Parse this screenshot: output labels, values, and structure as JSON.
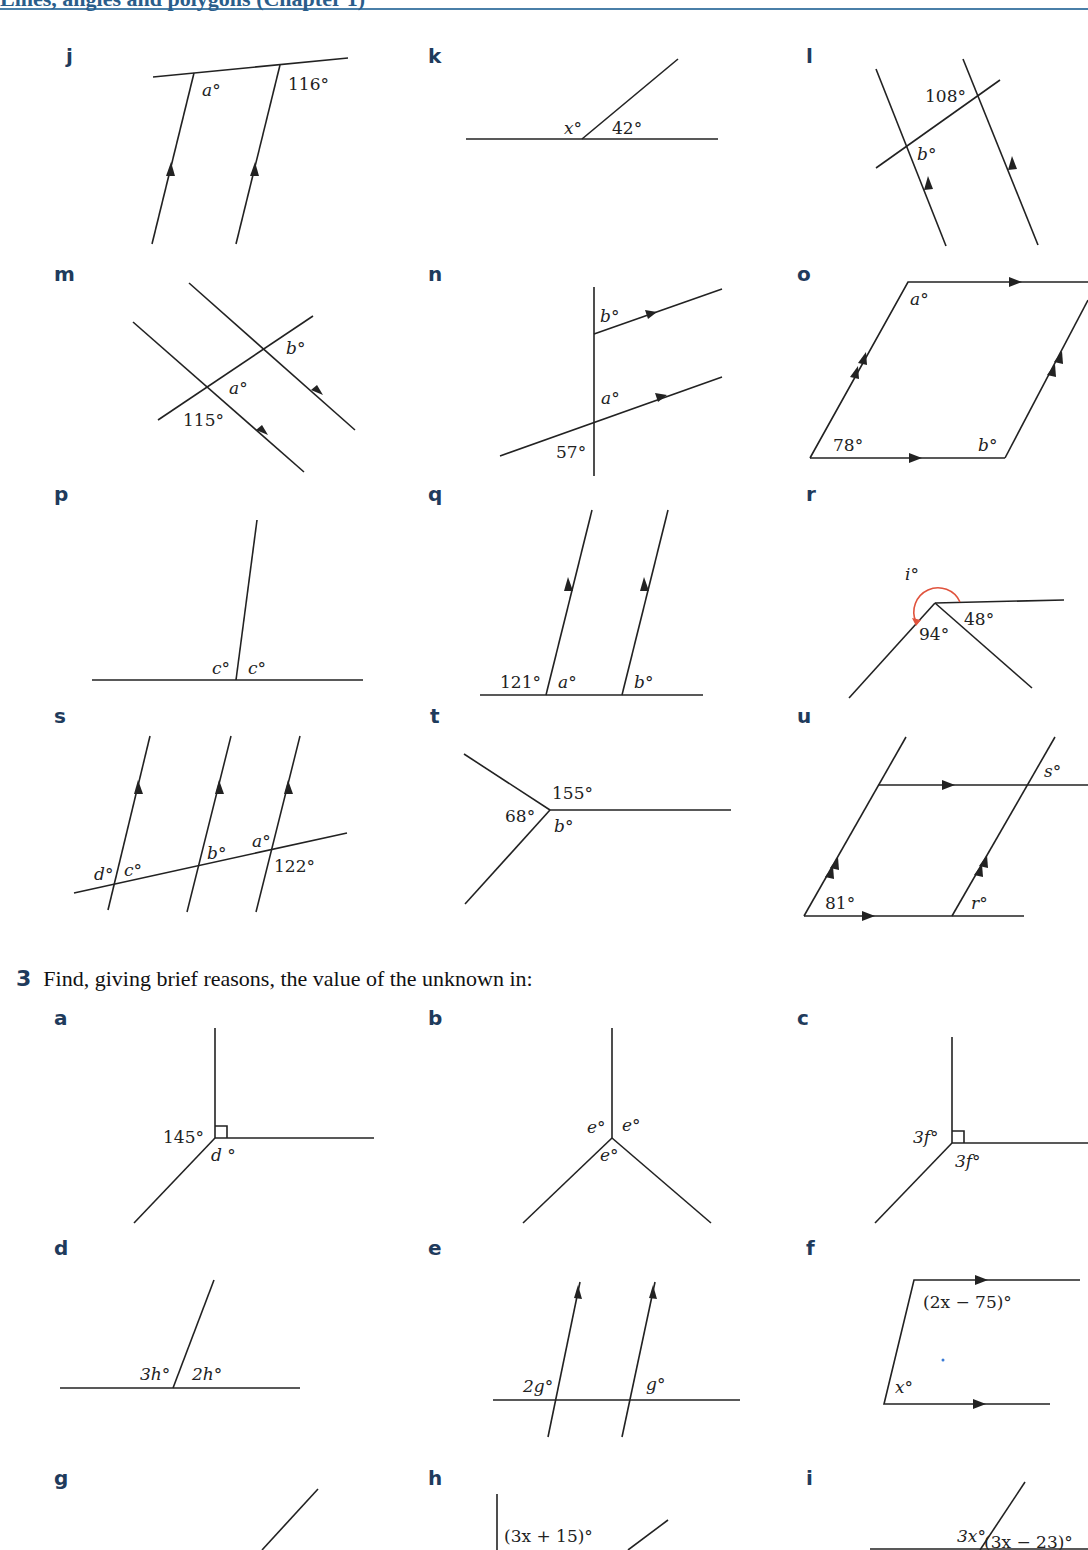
{
  "page": {
    "header_text": "Lines, angles and polygons (Chapter 1)",
    "header_color": "#4a7fa8",
    "label_color": "#1f3b5c"
  },
  "question2_parts": [
    {
      "letter": "j",
      "labels": [
        "a°",
        "116°"
      ]
    },
    {
      "letter": "k",
      "labels": [
        "x°",
        "42°"
      ]
    },
    {
      "letter": "l",
      "labels": [
        "108°",
        "b°"
      ]
    },
    {
      "letter": "m",
      "labels": [
        "b°",
        "a°",
        "115°"
      ]
    },
    {
      "letter": "n",
      "labels": [
        "b°",
        "a°",
        "57°"
      ]
    },
    {
      "letter": "o",
      "labels": [
        "a°",
        "78°",
        "b°"
      ]
    },
    {
      "letter": "p",
      "labels": [
        "c°",
        "c°"
      ]
    },
    {
      "letter": "q",
      "labels": [
        "121°",
        "a°",
        "b°"
      ]
    },
    {
      "letter": "r",
      "labels": [
        "i°",
        "48°",
        "94°"
      ]
    },
    {
      "letter": "s",
      "labels": [
        "d°",
        "c°",
        "b°",
        "a°",
        "122°"
      ]
    },
    {
      "letter": "t",
      "labels": [
        "155°",
        "68°",
        "b°"
      ]
    },
    {
      "letter": "u",
      "labels": [
        "s°",
        "81°",
        "r°"
      ]
    }
  ],
  "question3": {
    "number": "3",
    "prompt": "Find, giving brief reasons, the value of the unknown in:",
    "parts": [
      {
        "letter": "a",
        "labels": [
          "145°",
          "d °"
        ]
      },
      {
        "letter": "b",
        "labels": [
          "e°",
          "e°",
          "e°"
        ]
      },
      {
        "letter": "c",
        "labels": [
          "3f°",
          "3f°"
        ]
      },
      {
        "letter": "d",
        "labels": [
          "3h°",
          "2h°"
        ]
      },
      {
        "letter": "e",
        "labels": [
          "2g°",
          "g°"
        ]
      },
      {
        "letter": "f",
        "labels": [
          "(2x − 75)°",
          "x°"
        ]
      },
      {
        "letter": "g",
        "labels": []
      },
      {
        "letter": "h",
        "labels": [
          "(3x + 15)°"
        ]
      },
      {
        "letter": "i",
        "labels": [
          "3x°",
          "(3x − 23)°"
        ]
      }
    ]
  }
}
